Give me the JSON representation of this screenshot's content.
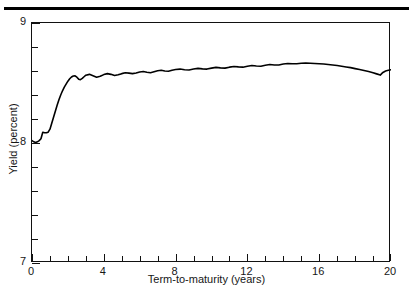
{
  "figure": {
    "background": "#ffffff",
    "rule_color": "#000000",
    "frame_color": "#111111",
    "curve_color": "#000000"
  },
  "chart_data": {
    "type": "line",
    "title": "",
    "subtitle": "",
    "xlabel": "Term-to-maturity (years)",
    "ylabel": "Yield (percent)",
    "xlim": [
      0,
      20
    ],
    "ylim": [
      7,
      9
    ],
    "grid": false,
    "legend": null,
    "xticks": [
      0,
      4,
      8,
      12,
      16,
      20
    ],
    "xticklabels": [
      "0",
      "4",
      "8",
      "12",
      "16",
      "20"
    ],
    "x_minor_tick_step": 1,
    "yticks": [
      7,
      8,
      9
    ],
    "yticklabels": [
      "7",
      "8",
      "9"
    ],
    "y_minor_tick_step": 0.2,
    "annotations": [],
    "series": [
      {
        "name": "yield curve",
        "x": [
          0.0,
          0.1,
          0.2,
          0.3,
          0.4,
          0.5,
          0.6,
          0.7,
          0.8,
          0.9,
          1.0,
          1.1,
          1.2,
          1.3,
          1.4,
          1.5,
          1.6,
          1.7,
          1.8,
          1.9,
          2.0,
          2.1,
          2.2,
          2.3,
          2.4,
          2.5,
          2.6,
          2.7,
          2.8,
          2.9,
          3.0,
          3.2,
          3.4,
          3.6,
          3.8,
          4.0,
          4.2,
          4.4,
          4.6,
          4.8,
          5.0,
          5.2,
          5.4,
          5.6,
          5.8,
          6.0,
          6.2,
          6.4,
          6.6,
          6.8,
          7.0,
          7.2,
          7.4,
          7.6,
          7.8,
          8.0,
          8.25,
          8.5,
          8.75,
          9.0,
          9.25,
          9.5,
          9.75,
          10.0,
          10.25,
          10.5,
          10.75,
          11.0,
          11.25,
          11.5,
          11.75,
          12.0,
          12.25,
          12.5,
          12.75,
          13.0,
          13.25,
          13.5,
          13.75,
          14.0,
          14.25,
          14.5,
          14.75,
          15.0,
          15.25,
          15.5,
          15.75,
          16.0,
          16.25,
          16.5,
          16.75,
          17.0,
          17.25,
          17.5,
          17.75,
          18.0,
          18.25,
          18.5,
          18.75,
          19.0,
          19.2,
          19.4,
          19.55,
          19.7,
          19.85,
          20.0
        ],
        "y": [
          8.02,
          8.01,
          8.005,
          8.01,
          8.02,
          8.035,
          8.09,
          8.085,
          8.085,
          8.09,
          8.115,
          8.165,
          8.215,
          8.265,
          8.315,
          8.36,
          8.4,
          8.435,
          8.465,
          8.49,
          8.515,
          8.535,
          8.55,
          8.558,
          8.56,
          8.548,
          8.532,
          8.528,
          8.538,
          8.552,
          8.565,
          8.572,
          8.56,
          8.548,
          8.556,
          8.57,
          8.578,
          8.572,
          8.562,
          8.568,
          8.578,
          8.586,
          8.582,
          8.578,
          8.584,
          8.592,
          8.596,
          8.59,
          8.586,
          8.594,
          8.602,
          8.606,
          8.6,
          8.598,
          8.606,
          8.612,
          8.616,
          8.61,
          8.608,
          8.616,
          8.622,
          8.618,
          8.616,
          8.624,
          8.63,
          8.626,
          8.624,
          8.632,
          8.638,
          8.634,
          8.632,
          8.64,
          8.646,
          8.642,
          8.64,
          8.648,
          8.654,
          8.65,
          8.65,
          8.658,
          8.662,
          8.66,
          8.66,
          8.664,
          8.666,
          8.664,
          8.662,
          8.66,
          8.658,
          8.654,
          8.65,
          8.646,
          8.64,
          8.634,
          8.628,
          8.62,
          8.612,
          8.604,
          8.596,
          8.586,
          8.576,
          8.566,
          8.588,
          8.6,
          8.606,
          8.61
        ]
      }
    ]
  }
}
